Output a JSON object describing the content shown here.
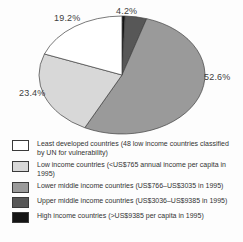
{
  "figure": {
    "background": "#fdfdfd",
    "stroke_color": "#404040"
  },
  "chart_data": {
    "type": "pie",
    "title": "",
    "unit": "%",
    "start_angle_deg": 0,
    "direction": "clockwise",
    "legend_position": "bottom",
    "geometry_hint": {
      "cx": 122,
      "cy": 75,
      "rx": 83,
      "ry": 59
    },
    "slices": [
      {
        "name": "high-income",
        "label": "High income countries (>US$9385 per capita in 1995)",
        "value": 0.6,
        "color": "#141414",
        "pct_label_visible": false
      },
      {
        "name": "upper-middle-income",
        "label": "Upper middle income countries (US$3036–US$9385 in 1995)",
        "value": 4.2,
        "color": "#575757",
        "pct_label_visible": true,
        "pct_label_text": "4.2%",
        "label_pos_hint": {
          "x": 116,
          "y": 6
        },
        "leader_hint": {
          "x1": 119.5,
          "y1": 16.5,
          "x2": 122.5,
          "y2": 23
        }
      },
      {
        "name": "lower-middle-income",
        "label": "Lower middle income countries (US$766–US$3035 in 1995)",
        "value": 52.6,
        "color": "#9a9a9a",
        "pct_label_visible": true,
        "pct_label_text": "52.6%",
        "label_pos_hint": {
          "x": 204,
          "y": 72
        }
      },
      {
        "name": "low-income",
        "label": "Low income countries (<US$765 annual income per capita in 1995)",
        "value": 23.4,
        "color": "#d8d8d8",
        "pct_label_visible": true,
        "pct_label_text": "23.4%",
        "label_pos_hint": {
          "x": 19,
          "y": 88
        }
      },
      {
        "name": "least-developed",
        "label": "Least developed countries (48 low income countries classified by UN for vulnerability)",
        "value": 19.2,
        "color": "#ffffff",
        "pct_label_visible": true,
        "pct_label_text": "19.2%",
        "label_pos_hint": {
          "x": 54,
          "y": 13
        }
      }
    ]
  },
  "legend": {
    "items": [
      {
        "name": "least-developed",
        "color": "#ffffff",
        "label": "Least developed countries (48 low income countries classified by UN for vulnerability)"
      },
      {
        "name": "low-income",
        "color": "#d8d8d8",
        "label": "Low income countries (<US$765 annual income per capita in 1995)"
      },
      {
        "name": "lower-middle-income",
        "color": "#9a9a9a",
        "label": "Lower middle income countries (US$766–US$3035 in 1995)"
      },
      {
        "name": "upper-middle-income",
        "color": "#575757",
        "label": "Upper middle income countries (US$3036–US$9385 in 1995)"
      },
      {
        "name": "high-income",
        "color": "#141414",
        "label": "High income countries (>US$9385 per capita in 1995)"
      }
    ]
  }
}
